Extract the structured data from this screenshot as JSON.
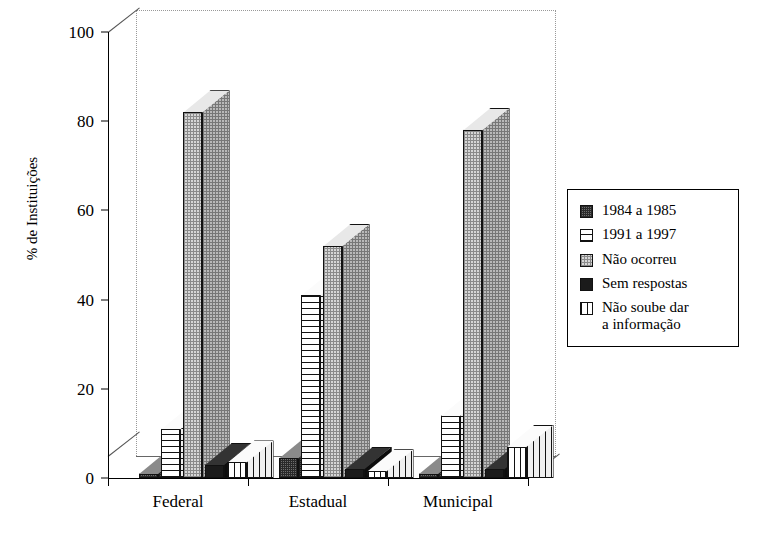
{
  "chart_data": {
    "type": "bar",
    "title": "",
    "subtitle": "",
    "xlabel": "",
    "ylabel": "% de Instituições",
    "categories": [
      "Federal",
      "Estadual",
      "Municipal"
    ],
    "ylim": [
      0,
      100
    ],
    "yticks": [
      0,
      20,
      40,
      60,
      80,
      100
    ],
    "ytick_labels": [
      "0",
      "20",
      "40",
      "60",
      "80",
      "100"
    ],
    "grid": false,
    "three_d": true,
    "legend_position": "right",
    "series": [
      {
        "name": "1984 a 1985",
        "pattern": "speckled-dark",
        "values": [
          1,
          4.5,
          1
        ]
      },
      {
        "name": "1991 a 1997",
        "pattern": "horizontal-lines",
        "values": [
          11,
          41,
          14
        ]
      },
      {
        "name": "Não ocorreu",
        "pattern": "light-dots",
        "values": [
          82,
          52,
          78
        ]
      },
      {
        "name": "Sem respostas",
        "pattern": "solid-black",
        "values": [
          3,
          2,
          2
        ]
      },
      {
        "name": "Não soube dar\na informação",
        "pattern": "vertical-lines",
        "values": [
          3.5,
          1.5,
          7
        ]
      }
    ]
  },
  "legend": {
    "items": [
      {
        "label": "1984 a 1985",
        "pattern": "speckled-dark"
      },
      {
        "label": "1991 a 1997",
        "pattern": "horizontal-lines"
      },
      {
        "label": "Não ocorreu",
        "pattern": "light-dots"
      },
      {
        "label": "Sem respostas",
        "pattern": "solid-black"
      },
      {
        "label": "Não soube dar\n a informação",
        "pattern": "vertical-lines"
      }
    ]
  }
}
